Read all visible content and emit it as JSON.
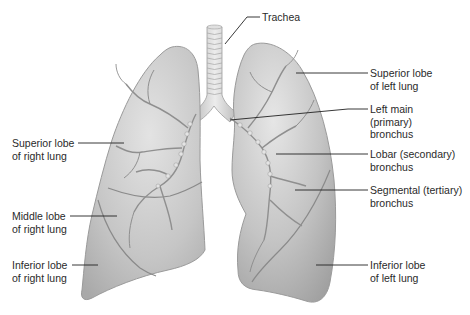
{
  "diagram": {
    "colors": {
      "background": "#ffffff",
      "lung_fill": "#c9c9c9",
      "lung_edge": "#9a9a9a",
      "lobe_fissure": "#8a8a8a",
      "bronchi": "#8f8f8f",
      "trachea": "#d6d6d6",
      "leader_line": "#222222",
      "text": "#2a2a2a"
    },
    "labels": [
      {
        "id": "trachea",
        "text": "Trachea",
        "x": 262,
        "y": 11
      },
      {
        "id": "superior-lobe-left",
        "text": "Superior lobe\nof left lung",
        "x": 370,
        "y": 67
      },
      {
        "id": "left-main-bronchus",
        "text": "Left main\n(primary)\nbronchus",
        "x": 370,
        "y": 103
      },
      {
        "id": "lobar-bronchus",
        "text": "Lobar (secondary)\nbronchus",
        "x": 370,
        "y": 148
      },
      {
        "id": "segmental-bronchus",
        "text": "Segmental (tertiary)\nbronchus",
        "x": 370,
        "y": 184
      },
      {
        "id": "superior-lobe-right",
        "text": "Superior lobe\nof right lung",
        "x": 12,
        "y": 137
      },
      {
        "id": "middle-lobe-right",
        "text": "Middle lobe\nof right lung",
        "x": 12,
        "y": 210
      },
      {
        "id": "inferior-lobe-right",
        "text": "Inferior lobe\nof right lung",
        "x": 12,
        "y": 259
      },
      {
        "id": "inferior-lobe-left",
        "text": "Inferior lobe\nof left lung",
        "x": 370,
        "y": 259
      }
    ]
  }
}
